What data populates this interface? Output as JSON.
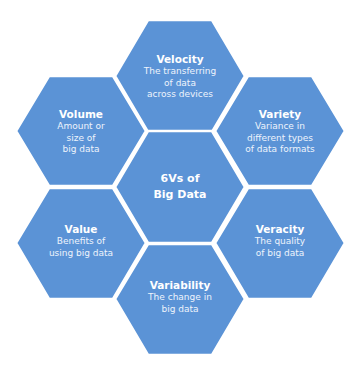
{
  "diagram": {
    "title": "6Vs of\nBig Data",
    "fill_color": "#5b93d6",
    "gap_color": "#ffffff",
    "center": {
      "label": "6Vs of\nBig Data",
      "cx": 180,
      "cy": 187
    },
    "nodes": [
      {
        "id": "velocity",
        "title": "Velocity",
        "description": "The transferring\nof data\nacross devices",
        "cx": 180,
        "cy": 76
      },
      {
        "id": "volume",
        "title": "Volume",
        "description": "Amount or\nsize of\nbig data",
        "cx": 81,
        "cy": 131
      },
      {
        "id": "variety",
        "title": "Variety",
        "description": "Variance in\ndifferent types\nof data formats",
        "cx": 280,
        "cy": 131
      },
      {
        "id": "value",
        "title": "Value",
        "description": "Benefits of\nusing big data",
        "cx": 81,
        "cy": 243
      },
      {
        "id": "veracity",
        "title": "Veracity",
        "description": "The quality\nof big data",
        "cx": 280,
        "cy": 243
      },
      {
        "id": "variability",
        "title": "Variability",
        "description": "The change in\nbig data",
        "cx": 180,
        "cy": 299
      }
    ]
  }
}
